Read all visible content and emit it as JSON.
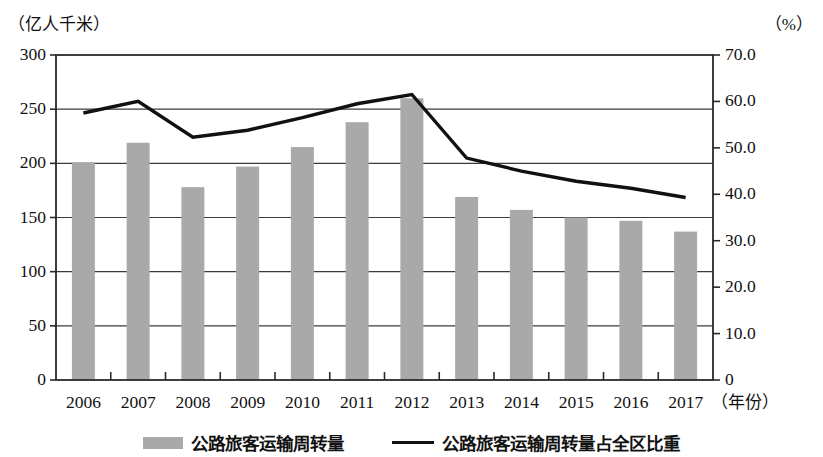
{
  "chart_data": {
    "type": "bar",
    "title": "",
    "subtitle": "",
    "xlabel": "（年份）",
    "ylabel": "（亿人千米）",
    "y2label": "（%）",
    "categories": [
      "2006",
      "2007",
      "2008",
      "2009",
      "2010",
      "2011",
      "2012",
      "2013",
      "2014",
      "2015",
      "2016",
      "2017"
    ],
    "series": [
      {
        "name": "公路旅客运输周转量",
        "type": "bar",
        "axis": "left",
        "unit": "亿人千米",
        "color": "#a9a9a9",
        "values": [
          201,
          219,
          178,
          197,
          215,
          238,
          260,
          169,
          157,
          150,
          147,
          137
        ]
      },
      {
        "name": "公路旅客运输周转量占全区比重",
        "type": "line",
        "axis": "right",
        "unit": "%",
        "color": "#111111",
        "values": [
          57.5,
          60.0,
          52.3,
          53.8,
          56.5,
          59.5,
          61.5,
          47.8,
          45.0,
          42.8,
          41.3,
          39.3
        ]
      }
    ],
    "ylim": [
      0,
      300
    ],
    "yticks": [
      "0",
      "50",
      "100",
      "150",
      "200",
      "250",
      "300"
    ],
    "ytick_values": [
      0,
      50,
      100,
      150,
      200,
      250,
      300
    ],
    "y2lim": [
      0,
      70
    ],
    "y2ticks": [
      "0",
      "10.0",
      "20.0",
      "30.0",
      "40.0",
      "50.0",
      "60.0",
      "70.0"
    ],
    "y2tick_values": [
      0,
      10,
      20,
      30,
      40,
      50,
      60,
      70
    ],
    "grid": true,
    "grid_axis": "y",
    "legend_position": "bottom"
  },
  "legend": {
    "bar_label": "公路旅客运输周转量",
    "line_label": "公路旅客运输周转量占全区比重"
  }
}
